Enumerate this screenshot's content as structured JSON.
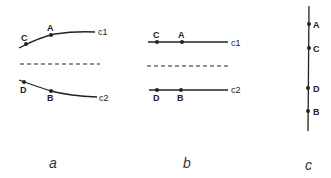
{
  "figure": {
    "panels": [
      {
        "id": "a",
        "label": "a",
        "description": "curved lines c1 and c2 separated by dashed line",
        "upper_curve": {
          "label": "c1",
          "points": [
            {
              "name": "C"
            },
            {
              "name": "A"
            }
          ]
        },
        "lower_curve": {
          "label": "c2",
          "points": [
            {
              "name": "D"
            },
            {
              "name": "B"
            }
          ]
        }
      },
      {
        "id": "b",
        "label": "b",
        "description": "straight lines c1 and c2 separated by dashed line",
        "upper_line": {
          "label": "c1",
          "points": [
            {
              "name": "C"
            },
            {
              "name": "A"
            }
          ]
        },
        "lower_line": {
          "label": "c2",
          "points": [
            {
              "name": "D"
            },
            {
              "name": "B"
            }
          ]
        }
      },
      {
        "id": "c",
        "label": "c",
        "description": "single vertical line with ordered points",
        "line": {
          "points": [
            {
              "name": "A"
            },
            {
              "name": "C"
            },
            {
              "name": "D"
            },
            {
              "name": "B"
            }
          ]
        }
      }
    ],
    "colors": {
      "ink": "#222222",
      "background": "#ffffff"
    }
  }
}
